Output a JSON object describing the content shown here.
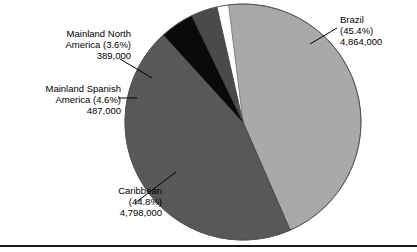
{
  "chart_data": {
    "type": "pie",
    "title": "",
    "subtitle": "",
    "xlabel": "",
    "ylabel": "",
    "legend_position": "none",
    "grid": false,
    "total": 10538000,
    "categories": [
      "Brazil",
      "Caribbean",
      "Mainland Spanish America",
      "Mainland North America"
    ],
    "values": [
      4864000,
      4798000,
      487000,
      389000
    ],
    "percentages": [
      45.4,
      44.8,
      4.6,
      3.6
    ],
    "slices": [
      {
        "name": "Brazil",
        "label_lines": [
          "Brazil",
          "(45.4%)",
          "4,864,000"
        ],
        "percent_text": "(45.4%)",
        "value_text": "4,864,000",
        "percent": 45.4,
        "value": 4864000,
        "color": "#a9a9a9"
      },
      {
        "name": "Caribbean",
        "label_lines": [
          "Caribbean",
          "(44.8%)",
          "4,798,000"
        ],
        "percent_text": "(44.8%)",
        "value_text": "4,798,000",
        "percent": 44.8,
        "value": 4798000,
        "color": "#585858"
      },
      {
        "name": "Mainland Spanish America",
        "label_lines": [
          "Mainland Spanish",
          "America (4.6%)",
          "487,000"
        ],
        "percent_text": "(4.6%)",
        "value_text": "487,000",
        "percent": 4.6,
        "value": 487000,
        "color": "#0a0a0a"
      },
      {
        "name": "Mainland North America",
        "label_lines": [
          "Mainland North",
          "America (3.6%)",
          "389,000"
        ],
        "percent_text": "(3.6%)",
        "value_text": "389,000",
        "percent": 3.6,
        "value": 389000,
        "color": "#4a4a4a"
      }
    ]
  },
  "figure": {
    "outline_color": "#4a4a4a",
    "rule_color": "#1a1a1a",
    "background": "#ffffff"
  },
  "labels": {
    "brazil": {
      "line1": "Brazil",
      "line2": "(45.4%)",
      "line3": "4,864,000"
    },
    "mainland_north_america": {
      "line1": "Mainland North",
      "line2": "America (3.6%)",
      "line3": "389,000"
    },
    "mainland_spanish_america": {
      "line1": "Mainland Spanish",
      "line2": "America (4.6%)",
      "line3": "487,000"
    },
    "caribbean": {
      "line1": "Caribbean",
      "line2": "(44.8%)",
      "line3": "4,798,000"
    }
  }
}
